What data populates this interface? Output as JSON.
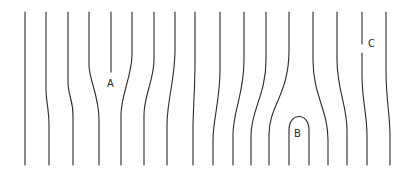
{
  "diagram": {
    "type": "flow-lines",
    "stroke_color": "#2a2a2a",
    "background": "#ffffff",
    "labels": [
      {
        "id": "A",
        "text": "A",
        "x": 107,
        "y": 79
      },
      {
        "id": "B",
        "text": "B",
        "x": 294,
        "y": 129
      },
      {
        "id": "C",
        "text": "C",
        "x": 368,
        "y": 39
      }
    ],
    "lines": [
      {
        "id": "line-1",
        "d": "M25,12 L25,165"
      },
      {
        "id": "line-2",
        "d": "M46,12 L46,90 C46,100 49,110 49,125 L49,165"
      },
      {
        "id": "line-3",
        "d": "M68,12 L68,82 C68,95 73,100 73,115 L73,165"
      },
      {
        "id": "line-4",
        "d": "M89,12 L89,65 C89,80 99,95 99,120 L99,165"
      },
      {
        "id": "line-5",
        "d": "M111,12 L111,72"
      },
      {
        "id": "line-6",
        "d": "M132,12 L132,55 C132,75 121,95 121,115 L121,165"
      },
      {
        "id": "line-7",
        "d": "M154,12 L154,60 C154,80 144,95 144,115 L144,165"
      },
      {
        "id": "line-8",
        "d": "M175,12 L175,50 C175,80 167,100 167,125 L167,165"
      },
      {
        "id": "line-9",
        "d": "M195,12 L195,60 C195,90 193,110 193,130 L193,165"
      },
      {
        "id": "line-10",
        "d": "M220,12 L220,70 C220,100 213,120 213,140 L213,165"
      },
      {
        "id": "line-11",
        "d": "M244,12 L244,60 C244,95 233,110 233,135 L233,165"
      },
      {
        "id": "line-12",
        "d": "M266,12 L266,60 C266,95 251,110 251,135 L251,165"
      },
      {
        "id": "line-13",
        "d": "M289,12 L289,50 C289,95 269,105 269,135 L269,165"
      },
      {
        "id": "line-B-loop",
        "d": "M289,165 L289,130 C289,112 309,112 309,130 L309,165"
      },
      {
        "id": "line-15",
        "d": "M313,12 L313,60 C313,95 328,110 328,140 L328,165"
      },
      {
        "id": "line-16",
        "d": "M337,12 L337,60 C337,90 347,105 347,130 L347,165"
      },
      {
        "id": "line-17a",
        "d": "M362,12 L362,44"
      },
      {
        "id": "line-17b",
        "d": "M362,53 L362,75 C362,100 367,115 367,135 L367,165"
      },
      {
        "id": "line-18",
        "d": "M386,12 L386,70 C386,100 390,115 390,135 L390,165"
      }
    ]
  }
}
